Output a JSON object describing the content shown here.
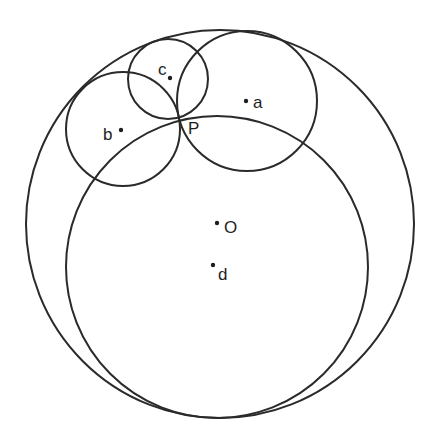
{
  "diagram": {
    "type": "circle-geometry",
    "stroke_color": "#2a2a2a",
    "circles": [
      {
        "id": "outer",
        "cx": 220,
        "cy": 224,
        "r": 194
      },
      {
        "id": "big-d",
        "cx": 217,
        "cy": 267,
        "r": 151
      },
      {
        "id": "circle-a",
        "cx": 247,
        "cy": 101,
        "r": 70
      },
      {
        "id": "circle-b",
        "cx": 123,
        "cy": 129,
        "r": 57
      },
      {
        "id": "circle-c",
        "cx": 168,
        "cy": 79,
        "r": 40
      }
    ],
    "points": [
      {
        "id": "a",
        "label": "a",
        "x": 246,
        "y": 101,
        "lx": 253,
        "ly": 108
      },
      {
        "id": "b",
        "label": "b",
        "x": 121,
        "y": 130,
        "lx": 103,
        "ly": 140
      },
      {
        "id": "c",
        "label": "c",
        "x": 170,
        "y": 78,
        "lx": 158,
        "ly": 75
      },
      {
        "id": "P",
        "label": "P",
        "x": 179,
        "y": 119,
        "lx": 188,
        "ly": 134
      },
      {
        "id": "O",
        "label": "O",
        "x": 217,
        "y": 223,
        "lx": 224,
        "ly": 233
      },
      {
        "id": "d",
        "label": "d",
        "x": 213,
        "y": 265,
        "lx": 218,
        "ly": 280
      }
    ]
  }
}
